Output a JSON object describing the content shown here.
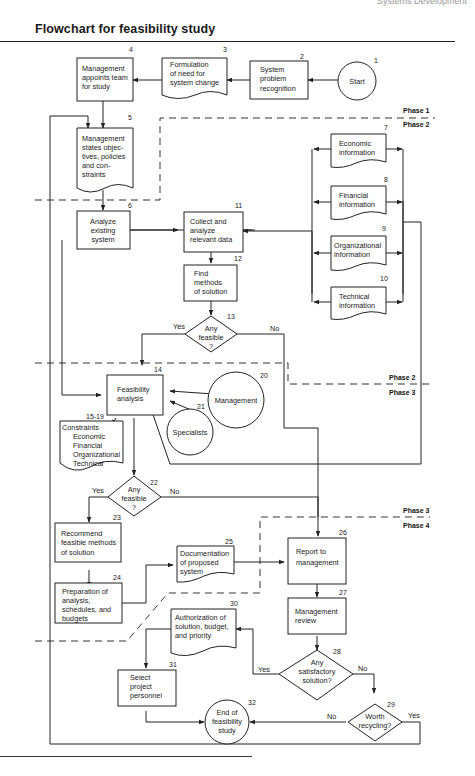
{
  "header": {
    "running_head": "Systems Development",
    "title": "Flowchart for feasibility study"
  },
  "phases": {
    "p1": "Phase 1",
    "p2": "Phase 2",
    "p3": "Phase 3",
    "p4": "Phase 4"
  },
  "nodes": {
    "n1": {
      "num": "1",
      "lines": [
        "Start"
      ]
    },
    "n2": {
      "num": "2",
      "lines": [
        "System",
        "problem",
        "recognition"
      ]
    },
    "n3": {
      "num": "3",
      "lines": [
        "Formulation",
        "of need for",
        "system change"
      ]
    },
    "n4": {
      "num": "4",
      "lines": [
        "Management",
        "appoints team",
        "for study"
      ]
    },
    "n5": {
      "num": "5",
      "lines": [
        "Management",
        "states objec-",
        "tives, policies",
        "and con-",
        "straints"
      ]
    },
    "n6": {
      "num": "6",
      "lines": [
        "Analyze",
        "existing",
        "system"
      ]
    },
    "n7": {
      "num": "7",
      "lines": [
        "Economic",
        "information"
      ]
    },
    "n8": {
      "num": "8",
      "lines": [
        "Financial",
        "information"
      ]
    },
    "n9": {
      "num": "9",
      "lines": [
        "Organizational",
        "information"
      ]
    },
    "n10": {
      "num": "10",
      "lines": [
        "Technical",
        "information"
      ]
    },
    "n11": {
      "num": "11",
      "lines": [
        "Collect and",
        "analyze",
        "relevant data"
      ]
    },
    "n12": {
      "num": "12",
      "lines": [
        "Find",
        "methods",
        "of solution"
      ]
    },
    "n13": {
      "num": "13",
      "lines": [
        "Any",
        "feasible",
        "?"
      ]
    },
    "n14": {
      "num": "14",
      "lines": [
        "Feasibility",
        "analysis"
      ]
    },
    "n15": {
      "num": "15-19",
      "lines": [
        "Constraints",
        "Economic",
        "Financial",
        "Organizational",
        "Technical"
      ]
    },
    "n20": {
      "num": "20",
      "lines": [
        "Management"
      ]
    },
    "n21": {
      "num": "21",
      "lines": [
        "Specialists"
      ]
    },
    "n22": {
      "num": "22",
      "lines": [
        "Any",
        "feasible",
        "?"
      ]
    },
    "n23": {
      "num": "23",
      "lines": [
        "Recommend",
        "feasible methods",
        "of solution"
      ]
    },
    "n24": {
      "num": "24",
      "lines": [
        "Preparation of",
        "analysis,",
        "schedules, and",
        "budgets"
      ]
    },
    "n25": {
      "num": "25",
      "lines": [
        "Documentation",
        "of proposed",
        "system"
      ]
    },
    "n26": {
      "num": "26",
      "lines": [
        "Report to",
        "management"
      ]
    },
    "n27": {
      "num": "27",
      "lines": [
        "Management",
        "review"
      ]
    },
    "n28": {
      "num": "28",
      "lines": [
        "Any",
        "satisfactory",
        "solution?"
      ]
    },
    "n29": {
      "num": "29",
      "lines": [
        "Worth",
        "recycling?"
      ]
    },
    "n30": {
      "num": "30",
      "lines": [
        "Authorization of",
        "solution, budget,",
        "and priority"
      ]
    },
    "n31": {
      "num": "31",
      "lines": [
        "Select",
        "project",
        "personnel"
      ]
    },
    "n32": {
      "num": "32",
      "lines": [
        "End of",
        "feasibility",
        "study"
      ]
    }
  },
  "edge_labels": {
    "yes": "Yes",
    "no": "No"
  }
}
